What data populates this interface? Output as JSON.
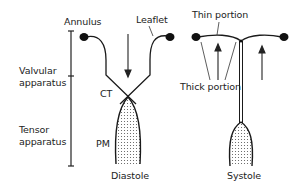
{
  "diagram": {
    "type": "anatomical-schematic",
    "labels": {
      "annulus": "Annulus",
      "leaflet": "Leaflet",
      "thin_portion": "Thin portion",
      "valvular_apparatus_line1": "Valvular",
      "valvular_apparatus_line2": "apparatus",
      "ct": "CT",
      "tensor_apparatus_line1": "Tensor",
      "tensor_apparatus_line2": "apparatus",
      "pm": "PM",
      "thick_portion": "Thick portion",
      "diastole": "Diastole",
      "systole": "Systole"
    },
    "panels": [
      {
        "name": "Diastole",
        "flow_arrow": "down",
        "state": "open"
      },
      {
        "name": "Systole",
        "flow_arrows": [
          "up",
          "up"
        ],
        "state": "closed"
      }
    ],
    "scale_bar": {
      "segments": [
        "Valvular apparatus",
        "Tensor apparatus"
      ]
    },
    "colors": {
      "line": "#1a1a1a",
      "fill_dots": "#555555",
      "background": "#ffffff"
    }
  }
}
